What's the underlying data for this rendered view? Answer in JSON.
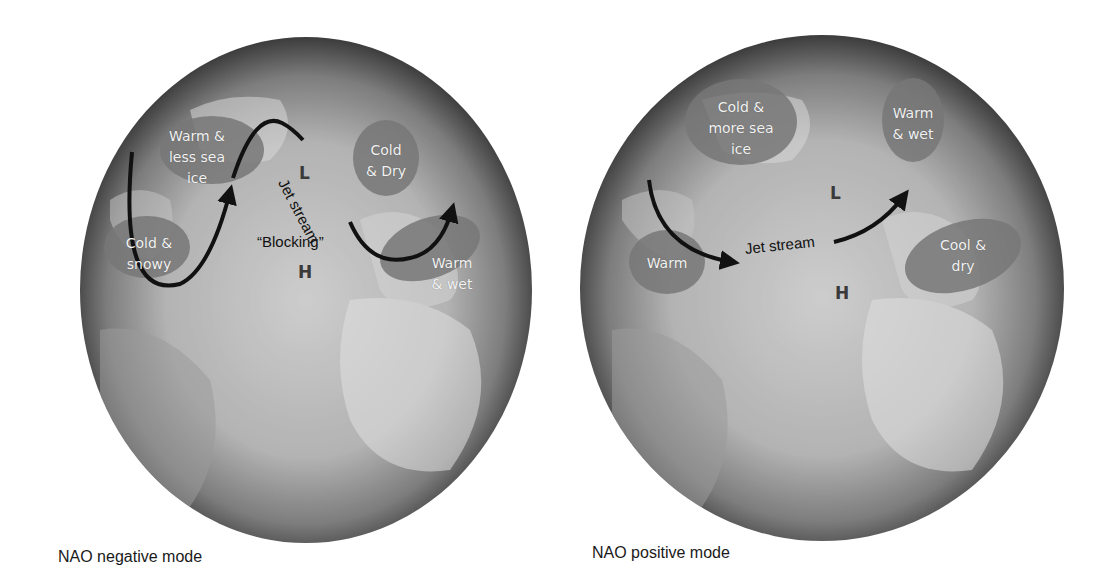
{
  "colors": {
    "background": "#ffffff",
    "globe_center": "#c9c9c9",
    "globe_edge": "#3a3a3a",
    "land": "#d6d6d6",
    "region_fill": "#777777",
    "jet_stream": "#111111",
    "region_text": "#f2f2f2",
    "caption_text": "#1a1a1a"
  },
  "panels": [
    {
      "id": "nao-negative",
      "caption": "NAO negative mode",
      "regions": [
        {
          "label": "Warm &\nless sea\nice",
          "fill": "#777777"
        },
        {
          "label": "Cold &\nsnowy",
          "fill": "#777777"
        },
        {
          "label": "Cold\n& Dry",
          "fill": "#777777"
        },
        {
          "label": "Warm\n& wet",
          "fill": "#777777"
        }
      ],
      "annotations": {
        "jet_stream": "Jet stream",
        "blocking": "“Blocking”",
        "low": "L",
        "high": "H"
      }
    },
    {
      "id": "nao-positive",
      "caption": "NAO positive mode",
      "regions": [
        {
          "label": "Cold &\nmore sea\nice",
          "fill": "#777777"
        },
        {
          "label": "Warm",
          "fill": "#777777"
        },
        {
          "label": "Warm\n& wet",
          "fill": "#777777"
        },
        {
          "label": "Cool &\ndry",
          "fill": "#777777"
        }
      ],
      "annotations": {
        "jet_stream": "Jet stream",
        "low": "L",
        "high": "H"
      }
    }
  ]
}
